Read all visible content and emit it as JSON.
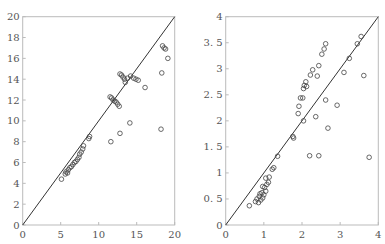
{
  "chart_data": [
    {
      "type": "scatter",
      "title": "",
      "xlabel": "",
      "ylabel": "",
      "xlim": [
        0,
        20
      ],
      "ylim": [
        0,
        20
      ],
      "grid": false,
      "reference_line": "y = x",
      "xticks": [
        "0",
        "5",
        "10",
        "15",
        "20"
      ],
      "yticks": [
        "0",
        "2",
        "4",
        "6",
        "8",
        "10",
        "12",
        "14",
        "16",
        "18",
        "20"
      ],
      "points": [
        [
          5.1,
          4.4
        ],
        [
          5.6,
          4.9
        ],
        [
          5.7,
          5.1
        ],
        [
          5.9,
          5.0
        ],
        [
          6.0,
          5.3
        ],
        [
          6.2,
          5.5
        ],
        [
          6.4,
          5.6
        ],
        [
          6.6,
          5.8
        ],
        [
          6.8,
          6.0
        ],
        [
          7.0,
          6.1
        ],
        [
          7.2,
          6.3
        ],
        [
          7.4,
          6.5
        ],
        [
          7.5,
          6.8
        ],
        [
          7.7,
          7.0
        ],
        [
          7.9,
          7.3
        ],
        [
          8.0,
          7.6
        ],
        [
          8.7,
          8.3
        ],
        [
          8.8,
          8.5
        ],
        [
          11.5,
          12.3
        ],
        [
          11.7,
          12.2
        ],
        [
          11.9,
          12.0
        ],
        [
          12.1,
          11.9
        ],
        [
          12.3,
          11.8
        ],
        [
          12.5,
          11.6
        ],
        [
          12.7,
          11.4
        ],
        [
          12.8,
          14.5
        ],
        [
          13.0,
          14.4
        ],
        [
          13.2,
          14.2
        ],
        [
          13.4,
          14.0
        ],
        [
          13.5,
          13.7
        ],
        [
          13.8,
          14.1
        ],
        [
          14.2,
          14.3
        ],
        [
          14.6,
          14.1
        ],
        [
          14.9,
          14.0
        ],
        [
          15.2,
          13.9
        ],
        [
          16.1,
          13.2
        ],
        [
          11.6,
          8.0
        ],
        [
          12.8,
          8.8
        ],
        [
          14.1,
          9.8
        ],
        [
          18.2,
          9.2
        ],
        [
          18.3,
          14.6
        ],
        [
          18.4,
          17.2
        ],
        [
          18.6,
          17.0
        ],
        [
          18.8,
          16.9
        ],
        [
          19.1,
          16.0
        ]
      ]
    },
    {
      "type": "scatter",
      "title": "",
      "xlabel": "",
      "ylabel": "",
      "xlim": [
        0,
        4
      ],
      "ylim": [
        0,
        4
      ],
      "grid": false,
      "reference_line": "y = x",
      "xticks": [
        "0",
        "1",
        "2",
        "3",
        "4"
      ],
      "yticks": [
        "0",
        "0.5",
        "1",
        "1.5",
        "2",
        "2.5",
        "3",
        "3.5",
        "4"
      ],
      "points": [
        [
          0.62,
          0.37
        ],
        [
          0.78,
          0.45
        ],
        [
          0.82,
          0.5
        ],
        [
          0.86,
          0.43
        ],
        [
          0.88,
          0.55
        ],
        [
          0.9,
          0.6
        ],
        [
          0.92,
          0.48
        ],
        [
          0.95,
          0.62
        ],
        [
          0.97,
          0.52
        ],
        [
          1.0,
          0.58
        ],
        [
          1.02,
          0.72
        ],
        [
          1.05,
          0.65
        ],
        [
          0.97,
          0.74
        ],
        [
          1.08,
          0.78
        ],
        [
          1.12,
          0.82
        ],
        [
          1.05,
          0.9
        ],
        [
          1.14,
          0.92
        ],
        [
          1.22,
          1.07
        ],
        [
          1.26,
          1.1
        ],
        [
          1.36,
          1.32
        ],
        [
          1.76,
          1.7
        ],
        [
          1.78,
          1.67
        ],
        [
          1.9,
          2.14
        ],
        [
          1.92,
          2.28
        ],
        [
          1.96,
          2.44
        ],
        [
          2.02,
          2.44
        ],
        [
          2.04,
          2.62
        ],
        [
          2.06,
          2.68
        ],
        [
          2.1,
          2.75
        ],
        [
          2.12,
          2.66
        ],
        [
          2.04,
          2.0
        ],
        [
          2.22,
          2.88
        ],
        [
          2.28,
          2.98
        ],
        [
          2.4,
          2.86
        ],
        [
          2.44,
          3.06
        ],
        [
          2.52,
          3.28
        ],
        [
          2.58,
          3.38
        ],
        [
          2.62,
          3.48
        ],
        [
          2.36,
          2.08
        ],
        [
          2.62,
          2.4
        ],
        [
          2.68,
          1.86
        ],
        [
          2.92,
          2.3
        ],
        [
          2.2,
          1.33
        ],
        [
          2.44,
          1.33
        ],
        [
          3.1,
          2.93
        ],
        [
          3.24,
          3.2
        ],
        [
          3.45,
          3.48
        ],
        [
          3.55,
          3.62
        ],
        [
          3.62,
          2.87
        ],
        [
          3.76,
          1.3
        ]
      ]
    }
  ]
}
